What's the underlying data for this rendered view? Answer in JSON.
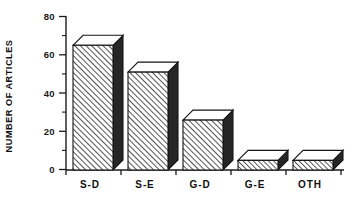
{
  "chart_data": {
    "type": "bar",
    "title": "",
    "subtitle": "",
    "xlabel": "",
    "ylabel": "NUMBER OF ARTICLES",
    "categories": [
      "S-D",
      "S-E",
      "G-D",
      "G-E",
      "OTH"
    ],
    "values": [
      65,
      51,
      26,
      5,
      5
    ],
    "series": [
      {
        "name": "Number of articles",
        "values": [
          65,
          51,
          26,
          5,
          5
        ]
      }
    ],
    "ylim": [
      0,
      80
    ],
    "xlim_categories": 5,
    "y_ticks_major": [
      0,
      20,
      40,
      60,
      80
    ],
    "y_tick_labels": [
      "0",
      "20",
      "40",
      "60",
      "80"
    ],
    "y_ticks_minor": [
      10,
      30,
      50,
      70
    ],
    "grid": "off",
    "legend": "none",
    "legend_position": "none",
    "annotations": [],
    "style": {
      "bar_style": "3d-extruded",
      "front_fill": "diagonal-hatch",
      "top_fill": "#ffffff",
      "side_fill": "#262626",
      "outline": "#141414",
      "background": "#ffffff",
      "axis_color": "#1a1a1a",
      "frame": "left-and-bottom-only"
    }
  },
  "axes": {
    "y_title": "NUMBER OF ARTICLES",
    "y_tick_0": "0",
    "y_tick_20": "20",
    "y_tick_40": "40",
    "y_tick_60": "60",
    "y_tick_80": "80"
  },
  "categories": {
    "c0": "S-D",
    "c1": "S-E",
    "c2": "G-D",
    "c3": "G-E",
    "c4": "OTH"
  }
}
